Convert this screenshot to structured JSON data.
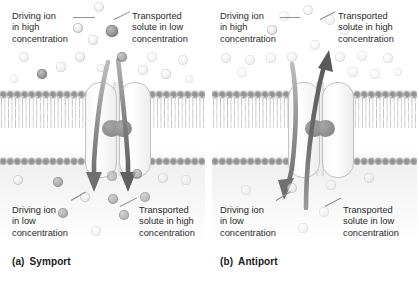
{
  "figure": {
    "panels": [
      {
        "id": "a",
        "caption_tag": "(a)",
        "caption_label": "Symport",
        "labels": {
          "top_left": "Driving ion\nin high\nconcentration",
          "top_right": "Transported\nsolute in low\nconcentration",
          "bottom_left": "Driving ion\nin low\nconcentration",
          "bottom_right": "Transported\nsolute in high\nconcentration"
        },
        "arrows": [
          {
            "name": "driving-ion-arrow",
            "direction": "down",
            "species": "driving-ion"
          },
          {
            "name": "solute-arrow",
            "direction": "down",
            "species": "transported-solute"
          }
        ]
      },
      {
        "id": "b",
        "caption_tag": "(b)",
        "caption_label": "Antiport",
        "labels": {
          "top_left": "Driving ion\nin high\nconcentration",
          "top_right": "Transported\nsolute in high\nconcentration",
          "bottom_left": "Driving ion\nin low\nconcentration",
          "bottom_right": "Transported\nsolute in low\nconcentration"
        },
        "arrows": [
          {
            "name": "driving-ion-arrow",
            "direction": "down",
            "species": "driving-ion"
          },
          {
            "name": "solute-arrow",
            "direction": "up",
            "species": "transported-solute"
          }
        ]
      }
    ],
    "legend_species": [
      {
        "name": "driving-ion",
        "appearance": "light circle",
        "color": "#e2e2e2"
      },
      {
        "name": "transported-solute",
        "appearance": "dark circle",
        "color": "#8a8a8a"
      }
    ],
    "structures": [
      {
        "name": "lipid-bilayer",
        "color": "#9c9c9c"
      },
      {
        "name": "transporter-protein",
        "color": "#f2f2f2"
      },
      {
        "name": "protein-binding-knob",
        "color": "#8a8a8a"
      }
    ],
    "background_color": "#ffffff"
  },
  "particles": {
    "panel_a_top": [
      {
        "t": "ion",
        "x": 99,
        "y": 7,
        "r": 5.2,
        "o": 0.45
      },
      {
        "t": "ion",
        "x": 78,
        "y": 28,
        "r": 5.0,
        "o": 0.85
      },
      {
        "t": "solute",
        "x": 112,
        "y": 31,
        "r": 5.6,
        "o": 0.95
      },
      {
        "t": "ion",
        "x": 93,
        "y": 40,
        "r": 4.6,
        "o": 0.5
      },
      {
        "t": "ion",
        "x": 24,
        "y": 57,
        "r": 5.0,
        "o": 0.4
      },
      {
        "t": "ion",
        "x": 80,
        "y": 57,
        "r": 5.0,
        "o": 0.55
      },
      {
        "t": "solute",
        "x": 122,
        "y": 57,
        "r": 5.2,
        "o": 0.75
      },
      {
        "t": "ion",
        "x": 152,
        "y": 57,
        "r": 4.6,
        "o": 0.35
      },
      {
        "t": "ion",
        "x": 183,
        "y": 60,
        "r": 5.0,
        "o": 0.4
      },
      {
        "t": "ion",
        "x": 61,
        "y": 67,
        "r": 4.6,
        "o": 0.45
      },
      {
        "t": "ion",
        "x": 101,
        "y": 68,
        "r": 4.4,
        "o": 0.4
      },
      {
        "t": "solute",
        "x": 42,
        "y": 74,
        "r": 5.4,
        "o": 0.9
      },
      {
        "t": "ion",
        "x": 143,
        "y": 70,
        "r": 4.8,
        "o": 0.45
      },
      {
        "t": "ion",
        "x": 166,
        "y": 74,
        "r": 4.6,
        "o": 0.5
      },
      {
        "t": "ion",
        "x": 189,
        "y": 79,
        "r": 4.4,
        "o": 0.3
      },
      {
        "t": "ion",
        "x": 14,
        "y": 79,
        "r": 4.4,
        "o": 0.28
      }
    ],
    "panel_a_bottom": [
      {
        "t": "ion",
        "x": 18,
        "y": 180,
        "r": 5.0,
        "o": 0.55
      },
      {
        "t": "solute",
        "x": 58,
        "y": 182,
        "r": 5.2,
        "o": 0.7
      },
      {
        "t": "solute",
        "x": 112,
        "y": 176,
        "r": 4.6,
        "o": 0.5
      },
      {
        "t": "solute",
        "x": 137,
        "y": 174,
        "r": 5.0,
        "o": 0.65
      },
      {
        "t": "ion",
        "x": 163,
        "y": 178,
        "r": 5.0,
        "o": 0.45
      },
      {
        "t": "ion",
        "x": 186,
        "y": 180,
        "r": 4.6,
        "o": 0.35
      },
      {
        "t": "ion",
        "x": 85,
        "y": 197,
        "r": 5.2,
        "o": 0.55
      },
      {
        "t": "solute",
        "x": 113,
        "y": 199,
        "r": 5.0,
        "o": 0.6
      },
      {
        "t": "solute",
        "x": 145,
        "y": 197,
        "r": 5.0,
        "o": 0.55
      },
      {
        "t": "solute",
        "x": 63,
        "y": 213,
        "r": 5.0,
        "o": 0.65
      },
      {
        "t": "solute",
        "x": 124,
        "y": 215,
        "r": 5.0,
        "o": 0.6
      },
      {
        "t": "ion",
        "x": 96,
        "y": 231,
        "r": 4.6,
        "o": 0.35
      }
    ],
    "panel_b_top": [
      {
        "t": "ion",
        "x": 96,
        "y": 10,
        "r": 5.0,
        "o": 0.45
      },
      {
        "t": "ion",
        "x": 72,
        "y": 16,
        "r": 5.0,
        "o": 0.3
      },
      {
        "t": "ion",
        "x": 118,
        "y": 20,
        "r": 4.8,
        "o": 0.4
      },
      {
        "t": "ion",
        "x": 60,
        "y": 30,
        "r": 5.2,
        "o": 0.8
      },
      {
        "t": "ion",
        "x": 133,
        "y": 30,
        "r": 4.8,
        "o": 0.35
      },
      {
        "t": "ion",
        "x": 103,
        "y": 45,
        "r": 4.8,
        "o": 0.4
      },
      {
        "t": "ion",
        "x": 14,
        "y": 58,
        "r": 5.0,
        "o": 0.45
      },
      {
        "t": "ion",
        "x": 38,
        "y": 60,
        "r": 4.8,
        "o": 0.4
      },
      {
        "t": "ion",
        "x": 59,
        "y": 58,
        "r": 4.6,
        "o": 0.35
      },
      {
        "t": "ion",
        "x": 80,
        "y": 57,
        "r": 5.0,
        "o": 0.45
      },
      {
        "t": "ion",
        "x": 128,
        "y": 57,
        "r": 4.8,
        "o": 0.4
      },
      {
        "t": "ion",
        "x": 150,
        "y": 56,
        "r": 4.8,
        "o": 0.35
      },
      {
        "t": "ion",
        "x": 176,
        "y": 58,
        "r": 4.8,
        "o": 0.4
      },
      {
        "t": "ion",
        "x": 30,
        "y": 72,
        "r": 4.6,
        "o": 0.3
      },
      {
        "t": "ion",
        "x": 141,
        "y": 72,
        "r": 4.6,
        "o": 0.35
      },
      {
        "t": "ion",
        "x": 163,
        "y": 74,
        "r": 4.6,
        "o": 0.3
      },
      {
        "t": "ion",
        "x": 186,
        "y": 72,
        "r": 4.4,
        "o": 0.28
      }
    ],
    "panel_b_bottom": [
      {
        "t": "ion",
        "x": 34,
        "y": 190,
        "r": 4.6,
        "o": 0.28
      },
      {
        "t": "ion",
        "x": 80,
        "y": 188,
        "r": 5.0,
        "o": 0.55
      },
      {
        "t": "ion",
        "x": 119,
        "y": 185,
        "r": 4.6,
        "o": 0.3
      },
      {
        "t": "ion",
        "x": 157,
        "y": 178,
        "r": 4.8,
        "o": 0.4
      },
      {
        "t": "ion",
        "x": 112,
        "y": 212,
        "r": 4.6,
        "o": 0.3
      },
      {
        "t": "ion",
        "x": 91,
        "y": 228,
        "r": 4.6,
        "o": 0.28
      }
    ]
  }
}
